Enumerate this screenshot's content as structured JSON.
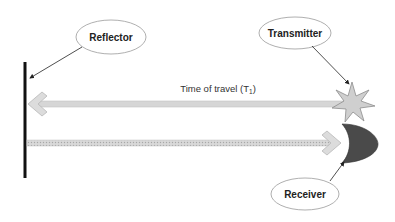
{
  "diagram": {
    "labels": {
      "reflector": "Reflector",
      "transmitter": "Transmitter",
      "receiver": "Receiver"
    },
    "caption": {
      "main": "Time of travel (T",
      "subscript": "1",
      "close": ")"
    },
    "nodes": [
      {
        "id": "reflector",
        "shape": "vertical-bar",
        "color": "#111111"
      },
      {
        "id": "transmitter",
        "shape": "star",
        "color": "#c8c8c8"
      },
      {
        "id": "receiver",
        "shape": "crescent",
        "color": "#4a4a4a"
      }
    ],
    "edges": [
      {
        "from": "transmitter",
        "to": "reflector",
        "style": "solid",
        "color": "#d4d4d4",
        "label": "Time of travel (T1)"
      },
      {
        "from": "reflector",
        "to": "receiver",
        "style": "dotted",
        "color": "#bdbdbd"
      }
    ],
    "callouts": [
      {
        "label": "Reflector",
        "points_to": "reflector"
      },
      {
        "label": "Transmitter",
        "points_to": "transmitter"
      },
      {
        "label": "Receiver",
        "points_to": "receiver"
      }
    ]
  }
}
